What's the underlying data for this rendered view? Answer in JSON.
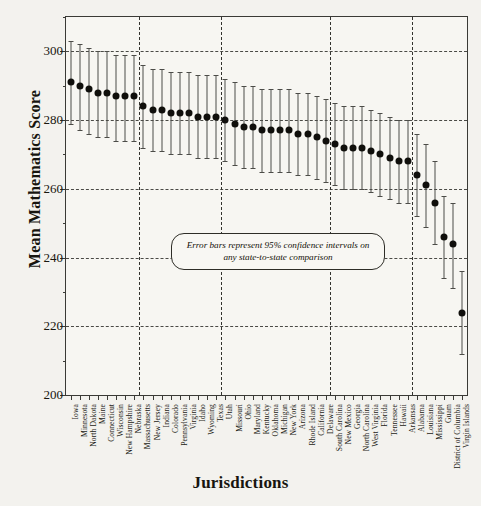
{
  "chart_data": {
    "type": "scatter",
    "title": "",
    "xlabel": "Jurisdictions",
    "ylabel": "Mean Mathematics Score",
    "ylim": [
      200,
      310
    ],
    "yticks": [
      200,
      220,
      240,
      260,
      280,
      300
    ],
    "yminor": [
      210,
      230,
      250,
      270,
      290,
      310
    ],
    "grid": "dashed-horizontal-and-vertical",
    "legend": "none",
    "annotation": "Error bars represent 95% confidence intervals on any state-to-state comparison",
    "error_bar_note": "95% confidence intervals",
    "vertical_gridline_indices": [
      8,
      17,
      29,
      38
    ],
    "categories": [
      "Iowa",
      "Minnesota",
      "North Dakota",
      "Maine",
      "Connecticut",
      "Wisconsin",
      "New Hampshire",
      "Nebraska",
      "Massachusetts",
      "New Jersey",
      "Indiana",
      "Colorado",
      "Pennsylvania",
      "Virginia",
      "Idaho",
      "Wyoming",
      "Texas",
      "Utah",
      "Missouri",
      "Ohio",
      "Maryland",
      "Kentucky",
      "Oklahoma",
      "Michigan",
      "New York",
      "Arizona",
      "Rhode Island",
      "California",
      "Delaware",
      "South Carolina",
      "New Mexico",
      "Georgia",
      "North Carolina",
      "West Virginia",
      "Florida",
      "Tennessee",
      "Hawaii",
      "Arkansas",
      "Alabama",
      "Louisiana",
      "Mississippi",
      "Guam",
      "District of Columbia",
      "Virgin Islands"
    ],
    "values": [
      291,
      290,
      289,
      288,
      288,
      287,
      287,
      287,
      284,
      283,
      283,
      282,
      282,
      282,
      281,
      281,
      281,
      280,
      279,
      278,
      278,
      277,
      277,
      277,
      277,
      276,
      276,
      275,
      274,
      273,
      272,
      272,
      272,
      271,
      270,
      269,
      268,
      268,
      264,
      261,
      256,
      246,
      244,
      224
    ],
    "ci_lower": [
      279,
      277,
      276,
      275,
      275,
      274,
      274,
      274,
      272,
      271,
      271,
      270,
      270,
      270,
      269,
      269,
      269,
      268,
      267,
      266,
      266,
      265,
      265,
      265,
      265,
      264,
      264,
      263,
      262,
      261,
      260,
      260,
      260,
      259,
      258,
      257,
      256,
      256,
      252,
      249,
      244,
      234,
      231,
      212
    ],
    "ci_upper": [
      303,
      302,
      301,
      300,
      300,
      299,
      299,
      299,
      296,
      295,
      295,
      294,
      294,
      294,
      293,
      293,
      293,
      292,
      291,
      290,
      290,
      289,
      289,
      289,
      289,
      288,
      288,
      287,
      286,
      285,
      284,
      284,
      284,
      283,
      282,
      281,
      280,
      280,
      276,
      273,
      268,
      258,
      256,
      236
    ]
  },
  "axes": {
    "y_title": "Mean Mathematics Score",
    "x_title": "Jurisdictions"
  }
}
